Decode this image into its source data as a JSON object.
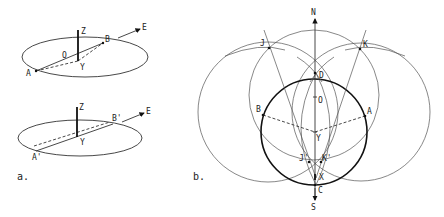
{
  "figure": {
    "panel_a": {
      "caption": "a.",
      "top": {
        "labels": {
          "Z": "Z",
          "O": "O",
          "B": "B",
          "E": "E",
          "A": "A",
          "Y": "Y"
        }
      },
      "bottom": {
        "labels": {
          "Z": "Z",
          "B": "B'",
          "E": "E",
          "A": "A'",
          "Y": "Y"
        }
      }
    },
    "panel_b": {
      "caption": "b.",
      "labels": {
        "N": "N",
        "J": "J",
        "K": "K",
        "D": "D",
        "O": "O",
        "B": "B",
        "A": "A",
        "Y": "Y",
        "J2": "J'",
        "K2": "K'",
        "X": "X",
        "C": "C",
        "S": "S"
      }
    }
  }
}
